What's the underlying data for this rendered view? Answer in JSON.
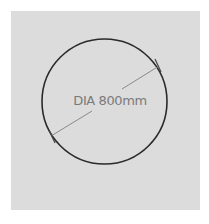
{
  "diagram": {
    "dimension_label": "DIA 800mm",
    "shape": "circle",
    "colors": {
      "panel": "#dcdcdc",
      "outline": "#2a2a2a",
      "dimension_line": "#8a8a8a",
      "label": "#7a7a7a"
    }
  }
}
